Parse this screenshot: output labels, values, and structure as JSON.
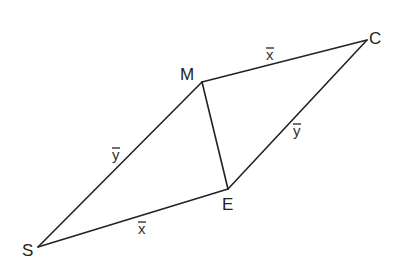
{
  "diagram": {
    "type": "parallelogram-vector-diagram",
    "vertices": [
      {
        "id": "S",
        "label": "S",
        "x": 38,
        "y": 247,
        "label_x": 22,
        "label_y": 256
      },
      {
        "id": "E",
        "label": "E",
        "x": 228,
        "y": 189,
        "label_x": 222,
        "label_y": 210
      },
      {
        "id": "C",
        "label": "C",
        "x": 367,
        "y": 40,
        "label_x": 369,
        "label_y": 44
      },
      {
        "id": "M",
        "label": "M",
        "x": 202,
        "y": 82,
        "label_x": 180,
        "label_y": 80
      }
    ],
    "edges": [
      {
        "from": "S",
        "to": "M",
        "vector": "y",
        "label": "y",
        "label_x": 112,
        "label_y": 160
      },
      {
        "from": "M",
        "to": "C",
        "vector": "x",
        "label": "x",
        "label_x": 266,
        "label_y": 60
      },
      {
        "from": "E",
        "to": "C",
        "vector": "y",
        "label": "y",
        "label_x": 293,
        "label_y": 136
      },
      {
        "from": "S",
        "to": "E",
        "vector": "x",
        "label": "x",
        "label_x": 138,
        "label_y": 234
      },
      {
        "from": "M",
        "to": "E",
        "vector": null,
        "label": null
      }
    ],
    "colors": {
      "stroke": "#222222",
      "background": "#ffffff"
    }
  }
}
